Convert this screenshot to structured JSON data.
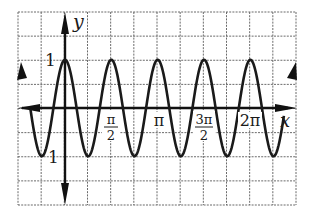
{
  "chart_data": {
    "type": "line",
    "title": "",
    "function": "y = cos(4x)",
    "xlabel": "x",
    "ylabel": "y",
    "x_tick_labels": [
      {
        "num": "π",
        "den": "2",
        "value": 1.5708
      },
      {
        "text": "π",
        "value": 3.1416
      },
      {
        "num": "3π",
        "den": "2",
        "value": 4.7124
      },
      {
        "text": "2π",
        "value": 6.2832
      }
    ],
    "y_tick_labels": [
      {
        "text": "1",
        "value": 1
      },
      {
        "text": "1",
        "value": -1,
        "note": "minus sign obscured by curve"
      }
    ],
    "xlim": [
      -1.5708,
      7.0686
    ],
    "ylim": [
      -2.25,
      2.0
    ],
    "grid": true,
    "grid_step_x": 0.7854,
    "grid_step_y": 0.5,
    "series": [
      {
        "name": "cos(4x)",
        "x": [
          -1.1781,
          -0.7854,
          0,
          0.7854,
          1.5708,
          2.3562,
          3.1416,
          3.927,
          4.7124,
          5.4978,
          6.2832,
          7.0686,
          7.4
        ],
        "values": [
          0.9,
          -1,
          1,
          -1,
          1,
          -1,
          1,
          -1,
          1,
          -1,
          1,
          -1,
          0.9
        ],
        "peaks_x": [
          0,
          1.5708,
          3.1416,
          4.7124,
          6.2832
        ],
        "troughs_x": [
          -0.7854,
          0.7854,
          2.3562,
          3.927,
          5.4978,
          7.0686
        ]
      }
    ]
  },
  "labels": {
    "y_axis": "y",
    "x_axis": "x",
    "y_one": "1",
    "y_minus_one": "1",
    "pi_half_num": "π",
    "pi_half_den": "2",
    "pi": "π",
    "three_pi_half_num": "3π",
    "three_pi_half_den": "2",
    "two_pi": "2π"
  }
}
